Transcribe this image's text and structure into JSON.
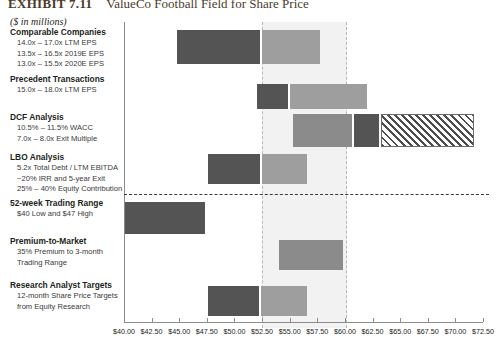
{
  "header": {
    "exhibit_number": "EXHIBIT 7.11",
    "title": "ValueCo Football Field for Share Price"
  },
  "units_note": "($ in millions)",
  "chart_data": {
    "type": "bar",
    "orientation": "horizontal",
    "title": "ValueCo Football Field for Share Price",
    "xlabel": "",
    "ylabel": "",
    "xlim": [
      40.0,
      72.5
    ],
    "xtick_step": 2.5,
    "grid": false,
    "legend": "none",
    "tick_labels": [
      "$40.00",
      "$42.50",
      "$45.00",
      "$47.50",
      "$50.00",
      "$52.50",
      "$55.00",
      "$57.50",
      "$60.00",
      "$62.50",
      "$65.00",
      "$67.50",
      "$70.00",
      "$72.50"
    ],
    "tick_values": [
      40.0,
      42.5,
      45.0,
      47.5,
      50.0,
      52.5,
      55.0,
      57.5,
      60.0,
      62.5,
      65.0,
      67.5,
      70.0,
      72.5
    ],
    "highlight_band": {
      "label": "Implied valuation range",
      "low": 52.5,
      "high": 60.0
    },
    "categories": [
      {
        "name": "Comparable Companies",
        "title": "Comparable Companies",
        "sublines": [
          "14.0x – 17.0x LTM EPS",
          "13.5x – 16.5x 2019E EPS",
          "13.0x – 15.5x 2020E EPS"
        ],
        "low": 44.8,
        "high": 57.7,
        "split": 52.5,
        "style": "split"
      },
      {
        "name": "Precedent Transactions",
        "title": "Precedent Transactions",
        "sublines": [
          "15.0x – 18.0x LTM EPS"
        ],
        "low": 52.0,
        "high": 62.0,
        "split": 55.0,
        "style": "split"
      },
      {
        "name": "DCF Analysis",
        "title": "DCF Analysis",
        "sublines": [
          "10.5% – 11.5% WACC",
          "7.0x – 8.0x Exit Multiple"
        ],
        "low": 55.3,
        "high": 71.7,
        "split": 60.8,
        "hatch_from": 63.3,
        "style": "hatched"
      },
      {
        "name": "LBO Analysis",
        "title": "LBO Analysis",
        "sublines": [
          "5.2x Total Debt / LTM EBITDA",
          "~20% IRR and 5-year Exit",
          "25% – 40% Equity Contribution"
        ],
        "low": 47.6,
        "high": 56.6,
        "split": 52.5,
        "style": "split"
      },
      {
        "name": "52-week Trading Range",
        "title": "52-week Trading Range",
        "sublines": [
          "$40 Low and $47 High"
        ],
        "low": 40.0,
        "high": 47.3,
        "split": null,
        "style": "solid"
      },
      {
        "name": "Premium-to-Market",
        "title": "Premium-to-Market",
        "sublines": [
          "35% Premium to 3-month",
          "Trading Range"
        ],
        "low": 54.0,
        "high": 59.8,
        "split": null,
        "style": "solid-mid"
      },
      {
        "name": "Research Analyst Targets",
        "title": "Research Analyst Targets",
        "sublines": [
          "12-month Share Price Targets",
          "from Equity Research"
        ],
        "low": 47.6,
        "high": 56.6,
        "split": 52.4,
        "style": "split"
      }
    ],
    "colors": {
      "dark": "#545454",
      "mid": "#8b8b8b",
      "light": "#9e9e9e",
      "band": "#f2f2f2",
      "band_border": "#b8b8b8",
      "axis": "#8c8c8c",
      "hatch": "#4d4d4d"
    }
  }
}
